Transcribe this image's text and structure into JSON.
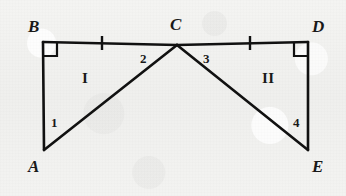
{
  "figure": {
    "background_color": "#f1f1ef",
    "stroke_color": "#111111",
    "text_color": "#191919",
    "width": 346,
    "height": 196
  },
  "vertices": [
    {
      "id": "B",
      "label": "B",
      "x": 43,
      "y": 42,
      "label_x": 28,
      "label_y": 18
    },
    {
      "id": "C",
      "label": "C",
      "x": 177,
      "y": 45,
      "label_x": 170,
      "label_y": 16
    },
    {
      "id": "D",
      "label": "D",
      "x": 308,
      "y": 42,
      "label_x": 312,
      "label_y": 18
    },
    {
      "id": "A",
      "label": "A",
      "x": 44,
      "y": 150,
      "label_x": 28,
      "label_y": 158
    },
    {
      "id": "E",
      "label": "E",
      "x": 308,
      "y": 150,
      "label_x": 312,
      "label_y": 158
    }
  ],
  "segments": [
    {
      "id": "BC",
      "from": "B",
      "to": "C",
      "tick_marks": 1
    },
    {
      "id": "CD",
      "from": "C",
      "to": "D",
      "tick_marks": 1
    },
    {
      "id": "BA",
      "from": "B",
      "to": "A",
      "tick_marks": 0
    },
    {
      "id": "DE",
      "from": "D",
      "to": "E",
      "tick_marks": 0
    },
    {
      "id": "AC",
      "from": "A",
      "to": "C",
      "tick_marks": 0
    },
    {
      "id": "CE",
      "from": "C",
      "to": "E",
      "tick_marks": 0
    }
  ],
  "tick_marks": [
    {
      "id": "tick-bc",
      "segment": "BC",
      "x": 102,
      "y": 43
    },
    {
      "id": "tick-cd",
      "segment": "CD",
      "x": 250,
      "y": 43
    }
  ],
  "right_angles": [
    {
      "id": "right-angle-b",
      "vertex": "B",
      "x": 43,
      "y": 42,
      "dir_x": 1,
      "dir_y": 1,
      "size": 14
    },
    {
      "id": "right-angle-d",
      "vertex": "D",
      "x": 308,
      "y": 42,
      "dir_x": -1,
      "dir_y": 1,
      "size": 14
    }
  ],
  "angle_labels": [
    {
      "id": "angle-1",
      "label": "1",
      "x": 51,
      "y": 116
    },
    {
      "id": "angle-2",
      "label": "2",
      "x": 140,
      "y": 52
    },
    {
      "id": "angle-3",
      "label": "3",
      "x": 203,
      "y": 52
    },
    {
      "id": "angle-4",
      "label": "4",
      "x": 293,
      "y": 116
    }
  ],
  "region_labels": [
    {
      "id": "region-1",
      "label": "I",
      "x": 82,
      "y": 71
    },
    {
      "id": "region-2",
      "label": "II",
      "x": 262,
      "y": 71
    }
  ]
}
